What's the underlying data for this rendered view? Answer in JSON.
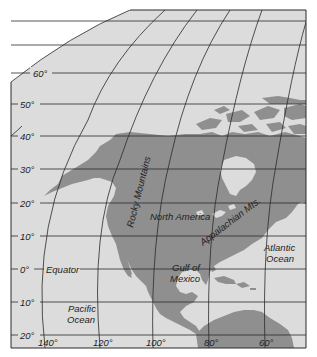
{
  "map": {
    "colors": {
      "background": "#ffffff",
      "ocean": "#dcdcdc",
      "land": "#8f8f8f",
      "grid": "#2a2a2a",
      "text": "#1e1e1e"
    },
    "latitude_labels": [
      {
        "label": "60°",
        "y": 73
      },
      {
        "label": "50°",
        "y": 104
      },
      {
        "label": "40°",
        "y": 136
      },
      {
        "label": "30°",
        "y": 169
      },
      {
        "label": "20°",
        "y": 203
      },
      {
        "label": "10°",
        "y": 236
      },
      {
        "label": "0°",
        "y": 269
      },
      {
        "label": "10°",
        "y": 302
      },
      {
        "label": "20°",
        "y": 335
      }
    ],
    "longitude_labels": [
      {
        "label": "140°",
        "x": 45
      },
      {
        "label": "120°",
        "x": 100
      },
      {
        "label": "100°",
        "x": 153
      },
      {
        "label": "80°",
        "x": 209
      },
      {
        "label": "60°",
        "x": 265
      }
    ],
    "place_labels": {
      "equator": "Equator",
      "pacific_line1": "Pacific",
      "pacific_line2": "Ocean",
      "rocky": "Rocky Mountains",
      "north_america": "North America",
      "appalachian": "Appalachian Mts.",
      "atlantic_line1": "Atlantic",
      "atlantic_line2": "Ocean",
      "gulf_line1": "Gulf of",
      "gulf_line2": "Mexico"
    }
  }
}
